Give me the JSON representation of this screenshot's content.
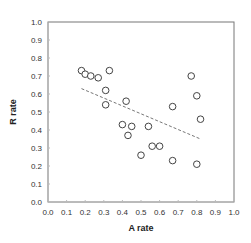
{
  "chart_data": {
    "type": "scatter",
    "title": "",
    "xlabel": "A rate",
    "ylabel": "R rate",
    "xlim": [
      0.0,
      1.0
    ],
    "ylim": [
      0.0,
      1.0
    ],
    "xticks": [
      "0.0",
      "0.1",
      "0.2",
      "0.3",
      "0.4",
      "0.5",
      "0.6",
      "0.7",
      "0.8",
      "0.9",
      "1.0"
    ],
    "yticks": [
      "0.0",
      "0.1",
      "0.2",
      "0.3",
      "0.4",
      "0.5",
      "0.6",
      "0.7",
      "0.8",
      "0.9",
      "1.0"
    ],
    "grid": false,
    "legend": null,
    "series": [
      {
        "name": "points",
        "marker": "open-circle",
        "points": [
          [
            0.18,
            0.73
          ],
          [
            0.2,
            0.71
          ],
          [
            0.23,
            0.7
          ],
          [
            0.27,
            0.69
          ],
          [
            0.33,
            0.73
          ],
          [
            0.31,
            0.62
          ],
          [
            0.31,
            0.54
          ],
          [
            0.42,
            0.56
          ],
          [
            0.4,
            0.43
          ],
          [
            0.45,
            0.42
          ],
          [
            0.43,
            0.37
          ],
          [
            0.54,
            0.42
          ],
          [
            0.5,
            0.26
          ],
          [
            0.56,
            0.31
          ],
          [
            0.6,
            0.31
          ],
          [
            0.67,
            0.53
          ],
          [
            0.67,
            0.23
          ],
          [
            0.77,
            0.7
          ],
          [
            0.8,
            0.59
          ],
          [
            0.82,
            0.46
          ],
          [
            0.8,
            0.21
          ]
        ]
      }
    ],
    "trendline": {
      "style": "dashed",
      "from": [
        0.18,
        0.63
      ],
      "to": [
        0.82,
        0.35
      ]
    }
  }
}
